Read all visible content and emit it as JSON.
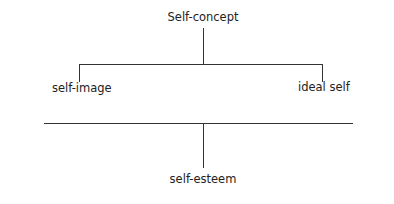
{
  "diagram": {
    "root": {
      "label": "Self-concept"
    },
    "branches": [
      {
        "label": "self-image"
      },
      {
        "label": "ideal self"
      }
    ],
    "result": {
      "label": "self-esteem"
    },
    "line_color": "#333333"
  }
}
